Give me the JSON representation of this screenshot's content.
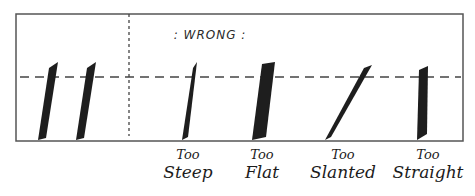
{
  "title_label": ": WRONG :",
  "colors": {
    "ink": "#1e1e1e",
    "frame": "#555555",
    "guide": "#444444",
    "background": "#ffffff"
  },
  "sections": {
    "correct": {
      "strokes": [
        {
          "name": "correct-stroke-1"
        },
        {
          "name": "correct-stroke-2"
        }
      ]
    },
    "wrong": {
      "label": ": WRONG :",
      "examples": [
        {
          "line1": "Too",
          "line2": "Steep"
        },
        {
          "line1": "Too",
          "line2": "Flat"
        },
        {
          "line1": "Too",
          "line2": "Slanted"
        },
        {
          "line1": "Too",
          "line2": "Straight"
        }
      ]
    }
  }
}
